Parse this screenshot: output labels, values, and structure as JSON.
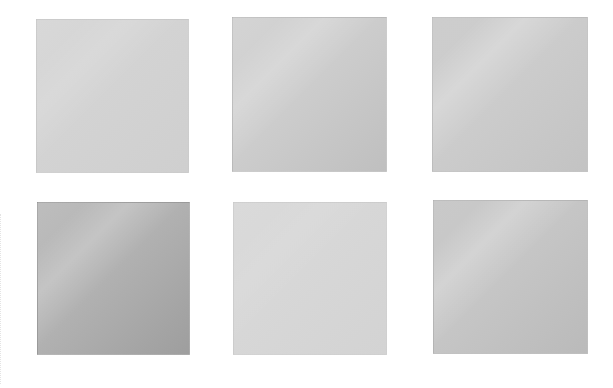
{
  "page": {
    "background": "#ffffff"
  },
  "swatches": [
    {
      "id": "swatch-1",
      "row": 1,
      "col": 1,
      "x": 36,
      "y": 19,
      "w": 153,
      "h": 154,
      "colors": {
        "start": "#d8d8d8",
        "mid": "#d3d3d3",
        "end": "#cfcfcf"
      },
      "sheen": "rgba(255,255,255,0.10)",
      "label": ""
    },
    {
      "id": "swatch-2",
      "row": 1,
      "col": 2,
      "x": 232,
      "y": 17,
      "w": 155,
      "h": 155,
      "colors": {
        "start": "#d4d4d4",
        "mid": "#cdcdcd",
        "end": "#bfbfbf"
      },
      "sheen": "rgba(255,255,255,0.18)",
      "label": ""
    },
    {
      "id": "swatch-3",
      "row": 1,
      "col": 3,
      "x": 432,
      "y": 17,
      "w": 156,
      "h": 155,
      "colors": {
        "start": "#cdcdcd",
        "mid": "#cccccc",
        "end": "#c3c3c3"
      },
      "sheen": "rgba(255,255,255,0.22)",
      "label": ""
    },
    {
      "id": "swatch-4",
      "row": 2,
      "col": 1,
      "x": 37,
      "y": 202,
      "w": 153,
      "h": 153,
      "colors": {
        "start": "#bdbdbd",
        "mid": "#b2b2b2",
        "end": "#9e9e9e"
      },
      "sheen": "rgba(255,255,255,0.20)",
      "label": ""
    },
    {
      "id": "swatch-5",
      "row": 2,
      "col": 2,
      "x": 233,
      "y": 202,
      "w": 154,
      "h": 153,
      "colors": {
        "start": "#dadada",
        "mid": "#d7d7d7",
        "end": "#d3d3d3"
      },
      "sheen": "rgba(255,255,255,0.06)",
      "label": ""
    },
    {
      "id": "swatch-6",
      "row": 2,
      "col": 3,
      "x": 433,
      "y": 200,
      "w": 155,
      "h": 154,
      "colors": {
        "start": "#c9c9c9",
        "mid": "#c6c6c6",
        "end": "#bababa"
      },
      "sheen": "rgba(255,255,255,0.22)",
      "label": ""
    }
  ]
}
